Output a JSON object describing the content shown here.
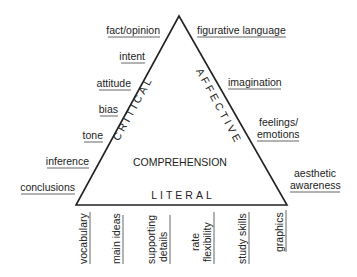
{
  "diagram": {
    "center_label": "COMPREHENSION",
    "sides": {
      "left": "CRITICAL",
      "right": "AFFECTIVE",
      "bottom": "LITERAL"
    },
    "critical_items": [
      "fact/opinion",
      "intent",
      "attitude",
      "bias",
      "tone",
      "inference",
      "conclusions"
    ],
    "affective_items": [
      "figurative language",
      "imagination",
      "feelings/",
      "emotions",
      "aesthetic",
      "awareness"
    ],
    "literal_items": [
      "vocabulary",
      "main ideas",
      "supporting",
      "details",
      "rate",
      "flexibility",
      "study skills",
      "graphics"
    ],
    "colors": {
      "line": "#222222",
      "text": "#222222"
    }
  }
}
